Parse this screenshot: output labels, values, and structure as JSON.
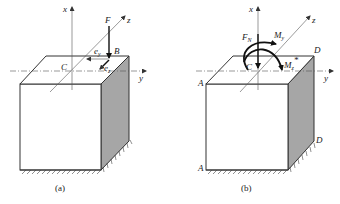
{
  "figure": {
    "panels": [
      {
        "id": "a",
        "caption": "(a)",
        "axes": {
          "x": "x",
          "y": "y",
          "z": "z"
        },
        "labels": {
          "center": "C",
          "point": "B",
          "force": "F",
          "ey_main": "e",
          "ey_sub": "y",
          "ez_main": "e",
          "ez_sub": "z"
        }
      },
      {
        "id": "b",
        "caption": "(b)",
        "axes": {
          "x": "x",
          "y": "y",
          "z": "z"
        },
        "labels": {
          "center": "C",
          "normal_force_main": "F",
          "normal_force_sub": "N",
          "my_main": "M",
          "my_sub": "y",
          "mz_main": "M",
          "mz_sub": "z",
          "mz_star": "*",
          "corner_a_top": "A",
          "corner_a_bottom": "A",
          "corner_d_top": "D",
          "corner_d_bottom": "D"
        }
      }
    ],
    "colors": {
      "line": "#333333",
      "side_face": "#a6a6a6",
      "front_face": "#ffffff"
    }
  }
}
